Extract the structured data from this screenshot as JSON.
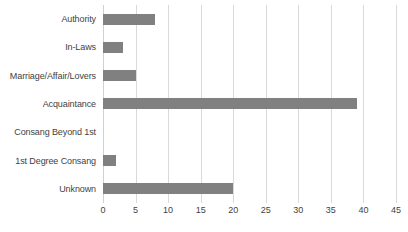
{
  "chart_data": {
    "type": "bar",
    "orientation": "horizontal",
    "title": "",
    "subtitle": "",
    "xlabel": "",
    "ylabel": "",
    "categories": [
      "Authority",
      "In-Laws",
      "Marriage/Affair/Lovers",
      "Acquaintance",
      "Consang Beyond 1st",
      "1st Degree Consang",
      "Unknown"
    ],
    "values": [
      8,
      3,
      5,
      39,
      0,
      2,
      20
    ],
    "xlim": [
      0,
      45
    ],
    "xticks": [
      0,
      5,
      10,
      15,
      20,
      25,
      30,
      35,
      40,
      45
    ],
    "tick_labels": [
      "0",
      "5",
      "10",
      "15",
      "20",
      "25",
      "30",
      "35",
      "40",
      "45"
    ],
    "grid": "vertical",
    "legend": "none",
    "bar_color": "#808080",
    "gridline_color": "#d9d9d9",
    "text_color": "#3f3f3f",
    "background_color": "#ffffff"
  }
}
